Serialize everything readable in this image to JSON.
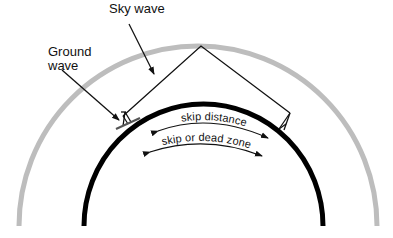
{
  "diagram": {
    "labels": {
      "sky_wave": "Sky wave",
      "ground_wave_line1": "Ground",
      "ground_wave_line2": "wave",
      "skip_distance": "skip distance",
      "skip_dead_zone": "skip or dead zone"
    },
    "colors": {
      "ionosphere": "#bdbdbd",
      "earth": "#000000",
      "lines": "#111111",
      "background": "#ffffff"
    },
    "elements": {
      "ionosphere_layer": "outer gray arc",
      "earth_surface": "inner black arc",
      "transmitter": "left antenna",
      "receiver": "right antenna"
    }
  }
}
